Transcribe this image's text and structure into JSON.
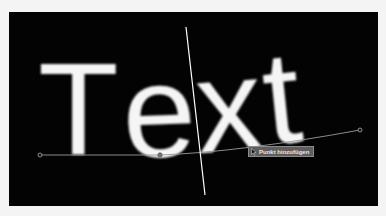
{
  "canvas": {
    "background": "#030303",
    "text_on_path": "Text",
    "glyphs": [
      {
        "char": "T",
        "x": 40,
        "y": 155,
        "size": 128,
        "rotate": 0
      },
      {
        "char": "e",
        "x": 126,
        "y": 157,
        "size": 128,
        "rotate": -2
      },
      {
        "char": "x",
        "x": 200,
        "y": 150,
        "size": 128,
        "rotate": -4
      },
      {
        "char": "t",
        "x": 268,
        "y": 142,
        "size": 128,
        "rotate": -6
      }
    ],
    "text_color": "#f5f5f5",
    "path": {
      "color": "#9a9a9a",
      "start_handle": {
        "x": 40,
        "y": 155
      },
      "control_point": {
        "x": 160,
        "y": 155
      },
      "end_handle": {
        "x": 360,
        "y": 130
      }
    },
    "guide_line": {
      "x1": 186,
      "y1": 27,
      "x2": 205,
      "y2": 195,
      "color": "#ffffff"
    }
  },
  "tooltip": {
    "label": "Punkt hinzufügen",
    "icon": "pen-add-point-cursor-icon"
  }
}
